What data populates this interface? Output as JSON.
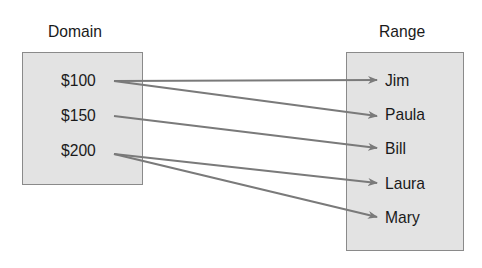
{
  "diagram": {
    "type": "mapping",
    "domain": {
      "title": "Domain",
      "items": [
        "$100",
        "$150",
        "$200"
      ]
    },
    "range": {
      "title": "Range",
      "items": [
        "Jim",
        "Paula",
        "Bill",
        "Laura",
        "Mary"
      ]
    },
    "mappings": [
      {
        "from": "$100",
        "to": "Jim"
      },
      {
        "from": "$100",
        "to": "Paula"
      },
      {
        "from": "$150",
        "to": "Bill"
      },
      {
        "from": "$200",
        "to": "Laura"
      },
      {
        "from": "$200",
        "to": "Mary"
      }
    ],
    "colors": {
      "box_fill": "#e3e3e3",
      "box_border": "#8a8a8a",
      "arrow": "#7a7a7a",
      "text": "#1a1a1a"
    }
  }
}
